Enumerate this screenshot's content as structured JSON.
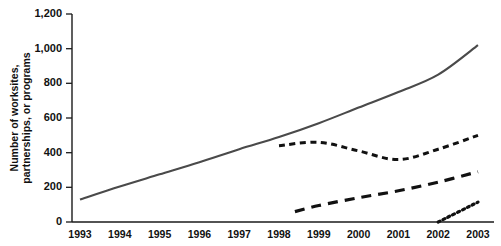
{
  "chart_data": {
    "type": "line",
    "title": "",
    "xlabel": "",
    "ylabel": "Number of worksites, partnerships, or programs",
    "ylabel_line1": "Number of worksites,",
    "ylabel_line2": "partnerships, or programs",
    "xlim": [
      1993,
      2003
    ],
    "ylim": [
      0,
      1200
    ],
    "ytick_values": [
      0,
      200,
      400,
      600,
      800,
      1000,
      1200
    ],
    "ytick_labels": [
      "0",
      "200",
      "400",
      "600",
      "800",
      "1,000",
      "1,200"
    ],
    "xtick_values": [
      1993,
      1994,
      1995,
      1996,
      1997,
      1998,
      1999,
      2000,
      2001,
      2002,
      2003
    ],
    "xtick_labels": [
      "1993",
      "1994",
      "1995",
      "1996",
      "1997",
      "1998",
      "1999",
      "2000",
      "2001",
      "2002",
      "2003"
    ],
    "grid": false,
    "legend": "none",
    "line_color": "#1a1a1a",
    "series": [
      {
        "name": "Worksites",
        "style": "solid",
        "x": [
          1993,
          1994,
          1995,
          1996,
          1997,
          1998,
          1999,
          2000,
          2001,
          2002,
          2003
        ],
        "values": [
          130,
          205,
          275,
          345,
          420,
          490,
          570,
          660,
          750,
          850,
          1020
        ]
      },
      {
        "name": "Partnerships",
        "style": "short-dash",
        "x": [
          1998,
          1999,
          2000,
          2001,
          2002,
          2003
        ],
        "values": [
          440,
          460,
          410,
          360,
          420,
          500
        ]
      },
      {
        "name": "Programs",
        "style": "long-dash",
        "x": [
          1998.4,
          1999,
          2000,
          2001,
          2002,
          2003
        ],
        "values": [
          60,
          95,
          140,
          180,
          230,
          290
        ]
      },
      {
        "name": "New initiatives",
        "style": "dotted",
        "x": [
          2002,
          2003
        ],
        "values": [
          0,
          115
        ]
      }
    ]
  }
}
